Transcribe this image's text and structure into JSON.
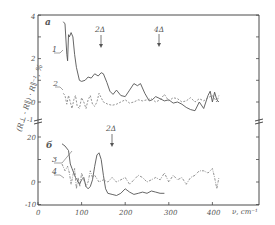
{
  "chart_data": [
    {
      "panel": "a",
      "type": "line",
      "title": "",
      "panel_label": "a",
      "xlabel": "ν, cm⁻¹",
      "ylabel": "(R⊥ - R∥) · R∥⁻¹, %",
      "xlim": [
        0,
        420
      ],
      "ylim": [
        -1,
        4
      ],
      "y_ticks": [
        0,
        2,
        4
      ],
      "x_ticks": [
        0,
        100,
        200,
        300,
        400
      ],
      "grid": false,
      "annotations": [
        {
          "text": "2Δ",
          "x": 140,
          "arrow": "down"
        },
        {
          "text": "4Δ",
          "x": 275,
          "arrow": "down"
        }
      ],
      "series": [
        {
          "name": "1",
          "style": "solid",
          "x": [
            58,
            62,
            66,
            68,
            70,
            72,
            76,
            80,
            84,
            88,
            95,
            100,
            108,
            115,
            122,
            130,
            138,
            145,
            150,
            158,
            165,
            172,
            180,
            190,
            200,
            210,
            220,
            228,
            235,
            245,
            255,
            262,
            270,
            280,
            290,
            300,
            310,
            320,
            330,
            340,
            350,
            360,
            370,
            380,
            390,
            395,
            400,
            405,
            410,
            415
          ],
          "values": [
            3.7,
            3.6,
            2.2,
            1.9,
            3.1,
            3.0,
            3.2,
            3.0,
            2.2,
            1.6,
            1.0,
            0.95,
            1.0,
            1.15,
            1.1,
            1.3,
            1.2,
            1.35,
            1.3,
            0.9,
            0.5,
            0.35,
            0.55,
            0.3,
            0.25,
            0.55,
            0.85,
            0.75,
            0.85,
            0.4,
            0.05,
            0.1,
            0.25,
            0.15,
            0.05,
            0.1,
            -0.05,
            0.0,
            -0.1,
            -0.25,
            -0.35,
            -0.4,
            0.0,
            -0.3,
            0.3,
            0.5,
            0.0,
            0.45,
            0.1,
            0.0
          ]
        },
        {
          "name": "2",
          "style": "dashed",
          "x": [
            58,
            62,
            66,
            70,
            74,
            78,
            82,
            86,
            90,
            95,
            100,
            105,
            110,
            115,
            120,
            125,
            130,
            135,
            140,
            145,
            150,
            160,
            170,
            180,
            190,
            200,
            210,
            220,
            230,
            240,
            250,
            260,
            270,
            280,
            290,
            300,
            310,
            320,
            330,
            340,
            350,
            360,
            370,
            380,
            390,
            400,
            410,
            415
          ],
          "values": [
            0.4,
            0.3,
            -0.1,
            0.3,
            0.0,
            -0.3,
            0.1,
            0.3,
            -0.2,
            -0.3,
            0.2,
            0.0,
            -0.3,
            0.1,
            0.3,
            -0.1,
            -0.2,
            0.0,
            0.4,
            0.2,
            0.0,
            -0.1,
            -0.15,
            -0.1,
            0.0,
            0.1,
            -0.05,
            0.0,
            0.1,
            0.05,
            0.1,
            0.15,
            0.0,
            0.1,
            0.35,
            0.05,
            0.2,
            0.15,
            0.0,
            0.05,
            0.2,
            0.0,
            0.15,
            0.05,
            0.2,
            0.3,
            0.0,
            0.3
          ]
        }
      ]
    },
    {
      "panel": "b",
      "type": "line",
      "title": "",
      "panel_label": "б",
      "xlabel": "ν, cm⁻¹",
      "ylabel": "(R⊥ - R∥) · R∥⁻¹, %",
      "xlim": [
        0,
        420
      ],
      "ylim": [
        -10,
        20
      ],
      "y_ticks": [
        -10,
        0,
        20
      ],
      "x_ticks": [
        0,
        100,
        200,
        300,
        400
      ],
      "grid": false,
      "annotations": [
        {
          "text": "2Δ",
          "x": 168,
          "arrow": "down"
        }
      ],
      "series": [
        {
          "name": "3",
          "style": "solid",
          "x": [
            55,
            62,
            70,
            74,
            78,
            82,
            86,
            90,
            95,
            100,
            105,
            110,
            115,
            120,
            125,
            130,
            135,
            140,
            145,
            150,
            155,
            160,
            170,
            180,
            190,
            200,
            210,
            220,
            230,
            240,
            250,
            260,
            270,
            280,
            290
          ],
          "values": [
            17,
            16,
            14,
            8,
            6,
            4,
            2,
            1,
            -1,
            1,
            2,
            -2,
            -3,
            -2,
            1,
            7,
            12,
            13,
            10,
            3,
            -3,
            -5,
            -5.5,
            -6,
            -5,
            -3,
            -4.5,
            -5.5,
            -5,
            -4.5,
            -5,
            -4,
            -4.5,
            -5,
            -5
          ]
        },
        {
          "name": "4",
          "style": "dashed",
          "x": [
            55,
            62,
            68,
            72,
            76,
            80,
            84,
            88,
            92,
            96,
            100,
            105,
            110,
            115,
            120,
            125,
            130,
            140,
            150,
            160,
            170,
            180,
            190,
            200,
            210,
            220,
            230,
            240,
            250,
            260,
            270,
            280,
            290,
            300,
            310,
            320,
            330,
            340,
            350,
            360,
            370,
            380,
            390,
            400,
            405,
            410,
            415
          ],
          "values": [
            8,
            5,
            7,
            4,
            -1,
            3,
            6,
            -3,
            2,
            -2,
            4,
            1,
            -2,
            0,
            5,
            2,
            3,
            0,
            1,
            0,
            2,
            0,
            1,
            2,
            -1,
            1,
            3,
            2,
            0,
            1,
            2,
            1,
            4,
            0,
            3,
            1,
            2,
            -1,
            2,
            3,
            5,
            5,
            4,
            6,
            2,
            -3,
            2
          ]
        }
      ]
    }
  ],
  "labels": {
    "panel_a": "a",
    "panel_b": "б",
    "curve_1": "1",
    "curve_2": "2",
    "curve_3": "3",
    "curve_4": "4",
    "arrow_2delta_a": "2Δ",
    "arrow_4delta_a": "4Δ",
    "arrow_2delta_b": "2Δ",
    "x_unit": "ν, cm⁻¹",
    "y_axis": "(R⊥ - R∥) · R∥⁻¹, %",
    "axis_break": "-1"
  },
  "ticks": {
    "x": [
      "0",
      "100",
      "200",
      "300",
      "400"
    ],
    "y_a": [
      "4",
      "2",
      "0"
    ],
    "y_b": [
      "20",
      "0",
      "-10"
    ]
  }
}
